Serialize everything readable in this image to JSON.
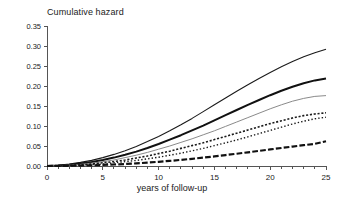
{
  "chart_data": {
    "type": "line",
    "title": "Cumulative hazard",
    "xlabel": "years of follow-up",
    "ylabel": "",
    "xlim": [
      0,
      25
    ],
    "ylim": [
      0.0,
      0.35
    ],
    "x_ticks": [
      "0",
      "5",
      "10",
      "15",
      "20",
      "25"
    ],
    "x_tick_values": [
      0,
      5,
      10,
      15,
      20,
      25
    ],
    "x_minor_tick_step": 1,
    "y_ticks": [
      "0.00",
      "0.05",
      "0.10",
      "0.15",
      "0.20",
      "0.25",
      "0.30",
      "0.35"
    ],
    "y_tick_values": [
      0.0,
      0.05,
      0.1,
      0.15,
      0.2,
      0.25,
      0.3,
      0.35
    ],
    "grid": false,
    "legend": "none",
    "x": [
      0,
      1,
      2,
      3,
      4,
      5,
      6,
      7,
      8,
      9,
      10,
      11,
      12,
      13,
      14,
      15,
      16,
      17,
      18,
      19,
      20,
      21,
      22,
      23,
      24,
      25
    ],
    "series": [
      {
        "name": "curve-1",
        "style": "solid",
        "color": "#1a1a1a",
        "width": 1.1,
        "end_value": 0.292,
        "values": [
          0.0,
          0.002,
          0.005,
          0.009,
          0.014,
          0.021,
          0.029,
          0.038,
          0.049,
          0.061,
          0.074,
          0.088,
          0.103,
          0.119,
          0.136,
          0.153,
          0.17,
          0.187,
          0.203,
          0.219,
          0.234,
          0.248,
          0.261,
          0.273,
          0.283,
          0.292
        ]
      },
      {
        "name": "curve-2",
        "style": "solid",
        "color": "#111111",
        "width": 2.0,
        "end_value": 0.219,
        "values": [
          0.0,
          0.001,
          0.003,
          0.006,
          0.01,
          0.015,
          0.021,
          0.028,
          0.036,
          0.045,
          0.055,
          0.066,
          0.077,
          0.089,
          0.101,
          0.114,
          0.127,
          0.14,
          0.153,
          0.165,
          0.177,
          0.188,
          0.198,
          0.207,
          0.214,
          0.219
        ]
      },
      {
        "name": "curve-3",
        "style": "solid",
        "color": "#8a8a8a",
        "width": 1.0,
        "end_value": 0.176,
        "values": [
          0.0,
          0.001,
          0.002,
          0.004,
          0.007,
          0.011,
          0.015,
          0.021,
          0.027,
          0.034,
          0.042,
          0.05,
          0.059,
          0.068,
          0.078,
          0.088,
          0.099,
          0.11,
          0.121,
          0.132,
          0.143,
          0.153,
          0.162,
          0.169,
          0.174,
          0.176
        ]
      },
      {
        "name": "curve-4",
        "style": "dashed-fine",
        "color": "#1a1a1a",
        "width": 1.6,
        "end_value": 0.133,
        "values": [
          0.0,
          0.0005,
          0.0015,
          0.003,
          0.005,
          0.008,
          0.011,
          0.015,
          0.02,
          0.025,
          0.031,
          0.037,
          0.044,
          0.051,
          0.058,
          0.066,
          0.074,
          0.082,
          0.09,
          0.098,
          0.106,
          0.113,
          0.12,
          0.126,
          0.13,
          0.133
        ]
      },
      {
        "name": "curve-5",
        "style": "dotted",
        "color": "#1a1a1a",
        "width": 1.4,
        "end_value": 0.122,
        "values": [
          0.0,
          0.0003,
          0.001,
          0.002,
          0.0035,
          0.005,
          0.008,
          0.011,
          0.014,
          0.018,
          0.022,
          0.027,
          0.032,
          0.038,
          0.044,
          0.051,
          0.058,
          0.065,
          0.073,
          0.081,
          0.089,
          0.097,
          0.105,
          0.112,
          0.118,
          0.122
        ]
      },
      {
        "name": "curve-6",
        "style": "dash-dot-thick",
        "color": "#111111",
        "width": 2.2,
        "end_value": 0.062,
        "values": [
          0.0,
          0.0002,
          0.0005,
          0.001,
          0.0017,
          0.0026,
          0.0037,
          0.005,
          0.0066,
          0.0084,
          0.0105,
          0.0128,
          0.0153,
          0.018,
          0.0209,
          0.024,
          0.0273,
          0.0307,
          0.0342,
          0.0378,
          0.0414,
          0.045,
          0.0486,
          0.0521,
          0.0554,
          0.062
        ]
      }
    ]
  }
}
